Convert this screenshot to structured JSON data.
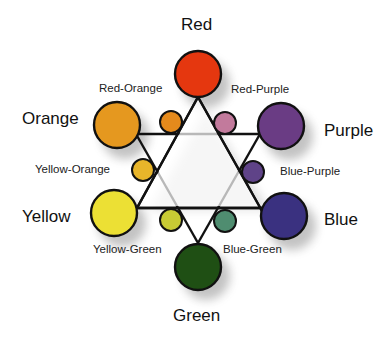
{
  "colors": {
    "red": {
      "label": "Red",
      "fill": "#e5370f"
    },
    "orange": {
      "label": "Orange",
      "fill": "#e5981f"
    },
    "yellow": {
      "label": "Yellow",
      "fill": "#ece034"
    },
    "green": {
      "label": "Green",
      "fill": "#1f4f14"
    },
    "blue": {
      "label": "Blue",
      "fill": "#3a3180"
    },
    "purple": {
      "label": "Purple",
      "fill": "#6a3c84"
    },
    "red_orange": {
      "label": "Red-Orange",
      "fill": "#e58a1c"
    },
    "red_purple": {
      "label": "Red-Purple",
      "fill": "#c27a9c"
    },
    "yellow_orange": {
      "label": "Yellow-Orange",
      "fill": "#e8b52a"
    },
    "blue_purple": {
      "label": "Blue-Purple",
      "fill": "#5f4388"
    },
    "yellow_green": {
      "label": "Yellow-Green",
      "fill": "#c8cb34"
    },
    "blue_green": {
      "label": "Blue-Green",
      "fill": "#4f8d70"
    }
  },
  "outline_color": "#111111"
}
